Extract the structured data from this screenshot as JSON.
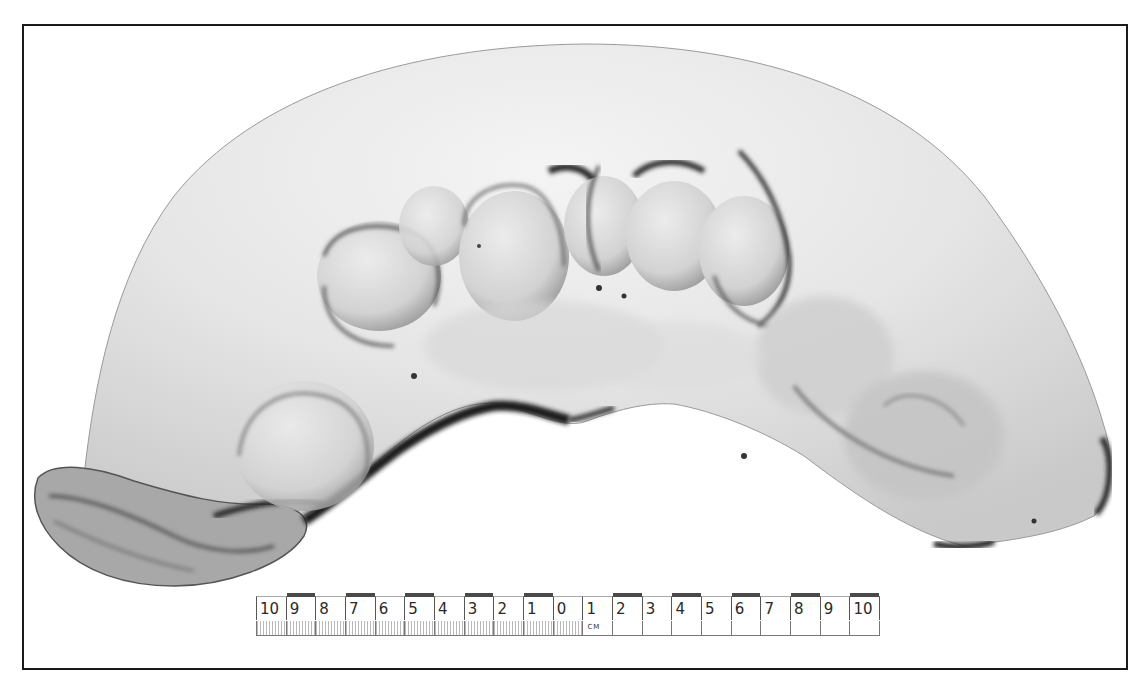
{
  "image": {
    "description": "Grayscale photograph of a bisected uterine specimen with multiple nodular fibroids, with centimeter scale bar",
    "background_color": "#ffffff",
    "frame_color": "#1a1a1a"
  },
  "scale_bar": {
    "unit": "CM",
    "labels": [
      "10",
      "9",
      "8",
      "7",
      "6",
      "5",
      "4",
      "3",
      "2",
      "1",
      "0",
      "1",
      "2",
      "3",
      "4",
      "5",
      "6",
      "7",
      "8",
      "9",
      "10"
    ],
    "dark_segments": [
      1,
      3,
      5,
      7,
      9,
      12,
      14,
      16,
      18,
      20
    ]
  }
}
